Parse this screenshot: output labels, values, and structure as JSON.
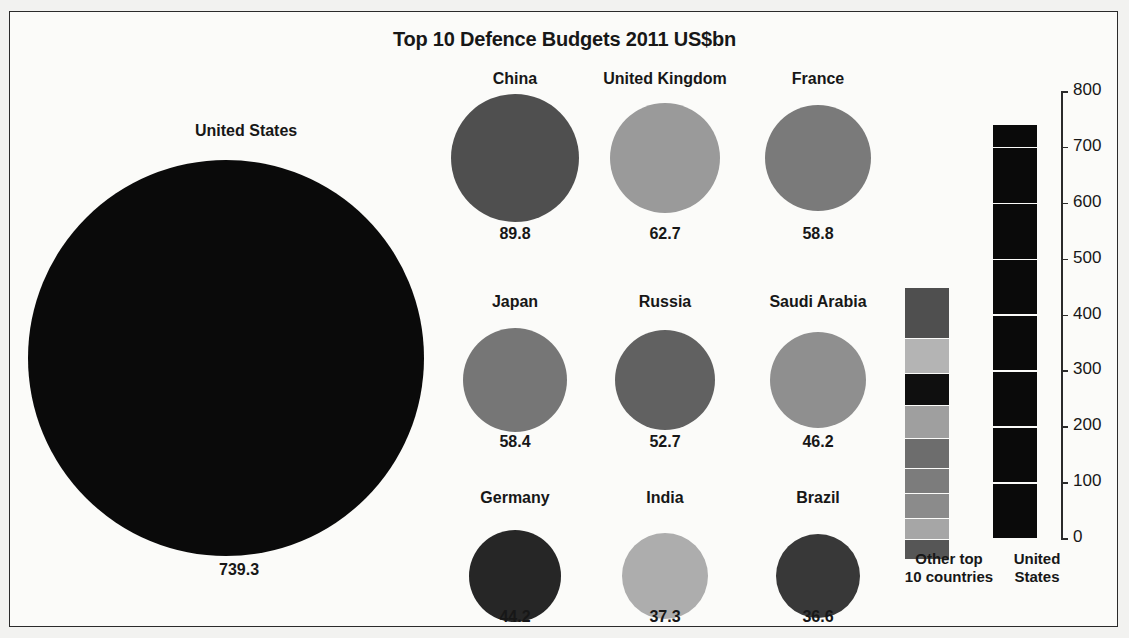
{
  "chart_data": {
    "type": "bar",
    "title": "Top 10 Defence Budgets 2011 US$bn",
    "xlabel": "",
    "ylabel": "",
    "ylim": [
      0,
      800
    ],
    "grid": true,
    "axis_ticks": [
      "800",
      "700",
      "600",
      "500",
      "400",
      "300",
      "200",
      "100",
      "0"
    ],
    "axis_tick_values": [
      800,
      700,
      600,
      500,
      400,
      300,
      200,
      100,
      0
    ],
    "categories": [
      "United States",
      "China",
      "United Kingdom",
      "France",
      "Japan",
      "Russia",
      "Saudi Arabia",
      "Germany",
      "India",
      "Brazil"
    ],
    "values": [
      739.3,
      89.8,
      62.7,
      58.8,
      58.4,
      52.7,
      46.2,
      44.2,
      37.3,
      36.6
    ],
    "bubbles": [
      {
        "name": "United States",
        "value": "739.3",
        "amount": 739.3,
        "color": "#0a0a0a"
      },
      {
        "name": "China",
        "value": "89.8",
        "amount": 89.8,
        "color": "#4f4f4f"
      },
      {
        "name": "United Kingdom",
        "value": "62.7",
        "amount": 62.7,
        "color": "#9a9a9a"
      },
      {
        "name": "France",
        "value": "58.8",
        "amount": 58.8,
        "color": "#7a7a7a"
      },
      {
        "name": "Japan",
        "value": "58.4",
        "amount": 58.4,
        "color": "#767676"
      },
      {
        "name": "Russia",
        "value": "52.7",
        "amount": 52.7,
        "color": "#616161"
      },
      {
        "name": "Saudi Arabia",
        "value": "46.2",
        "amount": 46.2,
        "color": "#8f8f8f"
      },
      {
        "name": "Germany",
        "value": "44.2",
        "amount": 44.2,
        "color": "#262626"
      },
      {
        "name": "India",
        "value": "37.3",
        "amount": 37.3,
        "color": "#adadad"
      },
      {
        "name": "Brazil",
        "value": "36.6",
        "amount": 36.6,
        "color": "#383838"
      }
    ],
    "comparison_bars": {
      "stacked": {
        "caption_line1": "Other top",
        "caption_line2": "10 countries",
        "total": 446.7,
        "segments": [
          {
            "name": "China",
            "amount": 89.8,
            "color": "#4f4f4f"
          },
          {
            "name": "United Kingdom",
            "amount": 62.7,
            "color": "#b4b4b4"
          },
          {
            "name": "France",
            "amount": 58.8,
            "color": "#0f0f0f"
          },
          {
            "name": "Japan",
            "amount": 58.4,
            "color": "#9f9f9f"
          },
          {
            "name": "Russia",
            "amount": 52.7,
            "color": "#6d6d6d"
          },
          {
            "name": "Saudi Arabia",
            "amount": 46.2,
            "color": "#7c7c7c"
          },
          {
            "name": "Germany",
            "amount": 44.2,
            "color": "#8b8b8b"
          },
          {
            "name": "India",
            "amount": 37.3,
            "color": "#a6a6a6"
          },
          {
            "name": "Brazil",
            "amount": 36.6,
            "color": "#565656"
          }
        ]
      },
      "single": {
        "caption_line1": "United",
        "caption_line2": "States",
        "name": "United States",
        "amount": 739.3,
        "color": "#0a0a0a"
      }
    },
    "colors": {
      "background": "#fbfbf9",
      "page_background": "#f2f2f0",
      "frame_border": "#2b2b2b",
      "text": "#171717",
      "gridline": "#fbfbf9"
    }
  }
}
